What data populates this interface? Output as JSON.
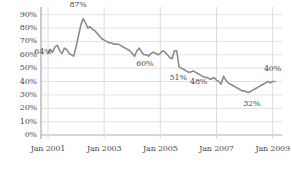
{
  "chart_data": {
    "type": "line",
    "title": "",
    "xlabel": "",
    "ylabel": "",
    "grid": true,
    "legend": "none",
    "line_color": "#8c8c8c",
    "text_color": "#4a4a4a",
    "grid_color": "#d9d9d9",
    "axis_color": "#b0b0b0",
    "ylim": [
      0,
      95
    ],
    "ytick_labels": [
      "90%",
      "80%",
      "70%",
      "60%",
      "50%",
      "40%",
      "30%",
      "20%",
      "10%",
      "0%"
    ],
    "ytick_values": [
      90,
      80,
      70,
      60,
      50,
      40,
      30,
      20,
      10,
      0
    ],
    "xtick_labels": [
      "Jan 2001",
      "Jan 2003",
      "Jan 2005",
      "Jan 2007",
      "Jan 2009"
    ],
    "xtick_values": [
      0,
      24,
      48,
      72,
      96
    ],
    "xlim": [
      -3,
      100
    ],
    "annotations": [
      {
        "text": "64%",
        "x": 1,
        "y": 64,
        "dx": -16,
        "dy": 3
      },
      {
        "text": "87%",
        "x": 13,
        "y": 87,
        "dx": -9,
        "dy": -14
      },
      {
        "text": "60%",
        "x": 42,
        "y": 60,
        "dx": -10,
        "dy": 9
      },
      {
        "text": "51%",
        "x": 55,
        "y": 51,
        "dx": -7,
        "dy": 11
      },
      {
        "text": "48%",
        "x": 62,
        "y": 48,
        "dx": -3,
        "dy": 11
      },
      {
        "text": "32%",
        "x": 86,
        "y": 32,
        "dx": -6,
        "dy": 12
      },
      {
        "text": "40%",
        "x": 97,
        "y": 40,
        "dx": -11,
        "dy": -13
      }
    ],
    "x": [
      0,
      1,
      2,
      3,
      4,
      5,
      6,
      7,
      8,
      9,
      10,
      11,
      12,
      13,
      14,
      15,
      16,
      17,
      18,
      19,
      20,
      21,
      22,
      23,
      24,
      25,
      26,
      27,
      28,
      29,
      30,
      31,
      32,
      33,
      34,
      35,
      36,
      37,
      38,
      39,
      40,
      41,
      42,
      43,
      44,
      45,
      46,
      47,
      48,
      49,
      50,
      51,
      52,
      53,
      54,
      55,
      56,
      57,
      58,
      59,
      60,
      61,
      62,
      63,
      64,
      65,
      66,
      67,
      68,
      69,
      70,
      71,
      72,
      73,
      74,
      75,
      76,
      77,
      78,
      79,
      80,
      81,
      82,
      83,
      84,
      85,
      86,
      87,
      88,
      89,
      90,
      91,
      92,
      93,
      94,
      95,
      96,
      97
    ],
    "values": [
      61,
      64,
      62,
      66,
      67,
      63,
      61,
      65,
      64,
      61,
      60,
      59,
      66,
      74,
      82,
      87,
      84,
      80,
      81,
      79,
      78,
      76,
      74,
      72,
      71,
      70,
      69,
      69,
      68,
      68,
      68,
      67,
      66,
      65,
      64,
      63,
      61,
      59,
      63,
      65,
      62,
      60,
      60,
      59,
      61,
      62,
      61,
      60,
      61,
      63,
      62,
      60,
      58,
      57,
      63,
      63,
      51,
      50,
      49,
      48,
      47,
      47,
      48,
      47,
      46,
      45,
      44,
      43,
      43,
      42,
      42,
      43,
      41,
      40,
      38,
      44,
      41,
      39,
      38,
      37,
      36,
      35,
      34,
      33,
      33,
      32,
      32,
      33,
      34,
      35,
      36,
      37,
      38,
      39,
      40,
      39,
      40,
      40
    ]
  }
}
